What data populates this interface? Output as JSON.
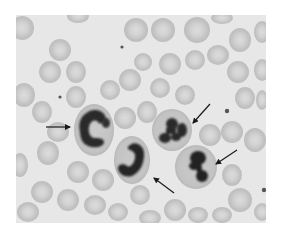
{
  "figure": {
    "colors": {
      "page_background": "#ffffff",
      "smear_background": "#e7e7e7",
      "rbc_fill": "#c9c9c9",
      "rbc_center": "#dadada",
      "rbc_edge": "#b4b4b4",
      "neutrophil_cytoplasm": "#c4c4c4",
      "nucleus": "#2a2a2a",
      "arrow": "#1a1a1a",
      "platelet": "#555555"
    },
    "frame": {
      "x": 16,
      "y": 15,
      "width": 250,
      "height": 208
    },
    "neutrophils": [
      {
        "id": 1,
        "nucleus_shape": "C-shaped band",
        "cx": 95,
        "cy": 130
      },
      {
        "id": 2,
        "nucleus_shape": "J-shaped band",
        "cx": 132,
        "cy": 158
      },
      {
        "id": 3,
        "nucleus_shape": "trilobed segmented",
        "cx": 172,
        "cy": 128
      },
      {
        "id": 4,
        "nucleus_shape": "bilobed segmented",
        "cx": 198,
        "cy": 166
      }
    ],
    "arrows": [
      {
        "points_to": 1,
        "from": [
          46,
          127
        ],
        "to": [
          70,
          127
        ]
      },
      {
        "points_to": 2,
        "from": [
          174,
          193
        ],
        "to": [
          154,
          178
        ]
      },
      {
        "points_to": 3,
        "from": [
          210,
          104
        ],
        "to": [
          193,
          123
        ]
      },
      {
        "points_to": 4,
        "from": [
          237,
          150
        ],
        "to": [
          216,
          164
        ]
      }
    ],
    "arrow_count": 4
  }
}
